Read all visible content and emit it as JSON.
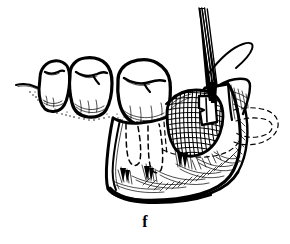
{
  "figure": {
    "panel_label": "f",
    "caption_position": "bottom-center",
    "media": "black ink line drawing",
    "background_color": "#ffffff",
    "ink_color": "#000000",
    "width_px": 290,
    "height_px": 244
  },
  "anatomy": {
    "teeth": [
      {
        "name": "premolar-crown",
        "label": "first molar crown",
        "position": "left"
      },
      {
        "name": "molar-crown",
        "label": "second molar crown",
        "position": "center-left"
      },
      {
        "name": "molar-crown-tilted",
        "label": "third molar crown",
        "position": "center"
      }
    ],
    "roots": {
      "name": "tooth-roots-dashed",
      "label": "buried root outlines",
      "style": "dashed",
      "count": 3
    },
    "bone": {
      "name": "mandible-body",
      "label": "mandibular body",
      "shading": "hatched"
    },
    "socket": {
      "name": "bone-defect-socket",
      "label": "cross-hatched bone defect",
      "texture": "dense cross-hatch"
    },
    "ramus": {
      "name": "ramus-hidden-outline",
      "label": "hidden ramus contour",
      "style": "dashed"
    },
    "gingiva": {
      "name": "gingival-margin",
      "label": "gingival margin line"
    },
    "flap": {
      "name": "soft-tissue-flap",
      "label": "reflected soft tissue flap"
    }
  },
  "instrument": {
    "name": "surgical-instrument",
    "label": "surgical instrument tip",
    "tine_count": 3,
    "entry": "top-right",
    "tip": {
      "name": "instrument-blade-tip",
      "label": "blade tip in socket"
    },
    "suture": {
      "name": "suture-thread",
      "label": "suture thread"
    }
  }
}
